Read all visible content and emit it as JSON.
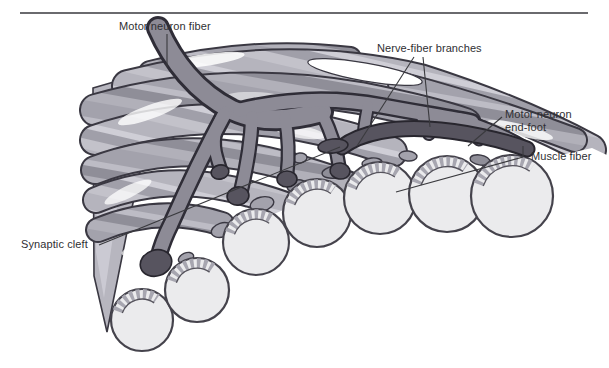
{
  "figure": {
    "type": "anatomical-illustration",
    "labels": {
      "motor_neuron_fiber": "Motor neuron fiber",
      "nerve_fiber_branches": "Nerve-fiber branches",
      "motor_neuron_end_foot": "Motor neuron end-foot",
      "muscle_fiber": "Muscle fiber",
      "synaptic_cleft": "Synaptic cleft"
    },
    "colors": {
      "background": "#ffffff",
      "muscle_fiber_light": "#cfced6",
      "muscle_fiber_mid": "#b5b4bd",
      "muscle_fiber_dark": "#a09fa9",
      "neuron_gray": "#8d8b96",
      "end_foot_dark": "#57545f",
      "outline_dark": "#3a3842",
      "cross_section_fill": "#ebebed",
      "top_rule": "#6a6a6e",
      "label_text": "#2f2f33"
    }
  }
}
